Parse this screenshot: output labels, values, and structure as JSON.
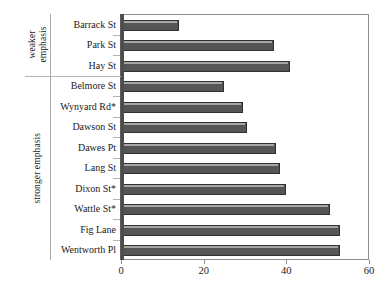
{
  "chart_data": {
    "type": "bar",
    "orientation": "horizontal",
    "title": "",
    "xlabel": "",
    "ylabel": "",
    "xlim": [
      0,
      60
    ],
    "xticks": [
      0,
      20,
      40,
      60
    ],
    "grid": false,
    "legend": null,
    "bar_color": "#555555",
    "bar_edge_color": "#2f2f2f",
    "categories": [
      "Barrack St",
      "Park St",
      "Hay  St",
      "Belmore St",
      "Wynyard Rd*",
      "Dawson St",
      "Dawes Pt",
      "Lang St",
      "Dixon St*",
      "Wattle St*",
      "Fig Lane",
      "Wentworth Pl"
    ],
    "values": [
      14,
      37,
      41,
      25,
      29.5,
      30.5,
      37.5,
      38.5,
      40,
      50.5,
      53,
      53
    ],
    "groups": [
      {
        "label_lines": [
          "weaker",
          "emphasis"
        ],
        "start_index": 0,
        "end_index": 2
      },
      {
        "label_lines": [
          "stronger emphasis"
        ],
        "start_index": 3,
        "end_index": 11
      }
    ]
  }
}
